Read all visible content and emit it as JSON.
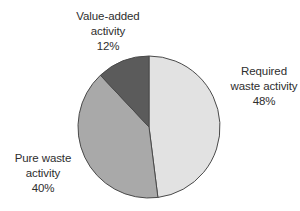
{
  "chart_data": {
    "type": "pie",
    "title": "",
    "start_angle_deg": 0,
    "direction": "clockwise",
    "slices": [
      {
        "name": "Required waste activity",
        "label_lines": [
          "Required",
          "waste activity"
        ],
        "value": 48,
        "value_label": "48%",
        "color": "#e2e2e2",
        "label_pos": {
          "x": 264,
          "y": 64
        }
      },
      {
        "name": "Pure waste activity",
        "label_lines": [
          "Pure waste",
          "activity"
        ],
        "value": 40,
        "value_label": "40%",
        "color": "#a9a9a9",
        "label_pos": {
          "x": 43,
          "y": 151
        }
      },
      {
        "name": "Value-added activity",
        "label_lines": [
          "Value-added",
          "activity"
        ],
        "value": 12,
        "value_label": "12%",
        "color": "#5b5b5b",
        "label_pos": {
          "x": 108,
          "y": 9
        }
      }
    ],
    "center": {
      "x": 149,
      "y": 127
    },
    "radius": 71,
    "stroke_color": "#4a4a4a",
    "legend": "none (direct labels)"
  }
}
